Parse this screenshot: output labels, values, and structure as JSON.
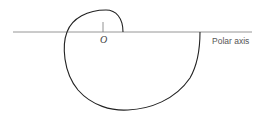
{
  "diagram": {
    "type": "polar-spiral",
    "labels": {
      "origin": "O",
      "axis": "Polar axis"
    },
    "colors": {
      "curve": "#222222",
      "axis": "#888888",
      "text": "#555555",
      "background": "#ffffff"
    }
  }
}
